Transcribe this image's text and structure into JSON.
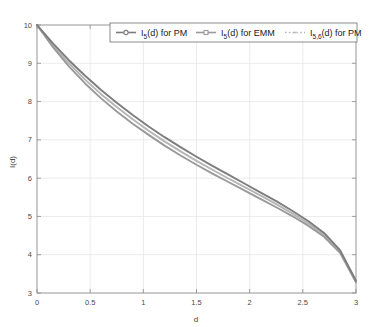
{
  "chart_data": {
    "type": "line",
    "title": "",
    "xlabel": "d",
    "ylabel": "I(d)",
    "xlim": [
      0,
      3
    ],
    "ylim": [
      3,
      10
    ],
    "grid": true,
    "legend_position": "top-right",
    "xticks": [
      "0",
      "0.5",
      "1",
      "1.5",
      "2",
      "2.5",
      "3"
    ],
    "xtick_values": [
      0,
      0.5,
      1,
      1.5,
      2,
      2.5,
      3
    ],
    "yticks": [
      "3",
      "4",
      "5",
      "6",
      "7",
      "8",
      "9",
      "10"
    ],
    "ytick_values": [
      3,
      4,
      5,
      6,
      7,
      8,
      9,
      10
    ],
    "x": [
      0,
      0.15,
      0.3,
      0.45,
      0.6,
      0.75,
      0.9,
      1.05,
      1.2,
      1.35,
      1.5,
      1.65,
      1.8,
      1.95,
      2.1,
      2.25,
      2.4,
      2.55,
      2.7,
      2.85,
      3
    ],
    "series": [
      {
        "name": "I_5(d) for PM",
        "label_main": "I",
        "label_sub": "5",
        "label_rest": "(d) for PM",
        "color": "#7d7d7d",
        "marker": "circle",
        "values": [
          10.0,
          9.52,
          9.08,
          8.68,
          8.31,
          7.97,
          7.65,
          7.35,
          7.07,
          6.81,
          6.56,
          6.32,
          6.09,
          5.86,
          5.63,
          5.4,
          5.15,
          4.88,
          4.57,
          4.12,
          3.32
        ]
      },
      {
        "name": "I_5(d) for EMM",
        "label_main": "I",
        "label_sub": "5",
        "label_rest": "(d) for EMM",
        "color": "#9a9a9a",
        "marker": "square",
        "values": [
          10.0,
          9.42,
          8.92,
          8.48,
          8.09,
          7.74,
          7.42,
          7.13,
          6.85,
          6.59,
          6.35,
          6.12,
          5.9,
          5.68,
          5.46,
          5.24,
          5.01,
          4.76,
          4.47,
          4.05,
          3.28
        ]
      },
      {
        "name": "I_5,6(d) for PM",
        "label_main": "I",
        "label_sub": "5,6",
        "label_rest": "(d) for PM",
        "color": "#b5b5b5",
        "marker": "dot",
        "values": [
          10.0,
          9.47,
          9.0,
          8.58,
          8.2,
          7.86,
          7.54,
          7.24,
          6.96,
          6.7,
          6.45,
          6.22,
          5.99,
          5.77,
          5.55,
          5.32,
          5.08,
          4.82,
          4.52,
          4.09,
          3.3
        ]
      }
    ]
  },
  "axes": {
    "x_label": "d",
    "y_label": "I(d)"
  }
}
